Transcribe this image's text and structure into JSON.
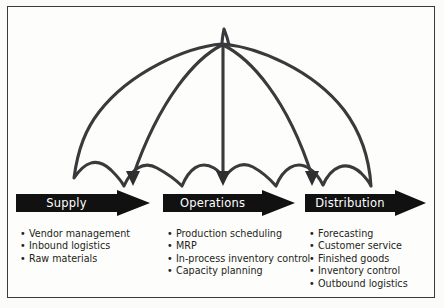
{
  "diagram": {
    "background_color": "#fbfbf9",
    "border_color": "#3a3a3c",
    "ink_color": "#231f20",
    "arrow_fill": "#111111",
    "arrow_text_color": "#ffffff",
    "bullet_glyph": "•"
  },
  "umbrella": {
    "name": "umbrella-canopy",
    "outline_color": "#3a3a3c",
    "scallop_count": 4,
    "rib_count": 3,
    "has_finial": true,
    "rib_tips_are_arrowheads": true
  },
  "stages": [
    {
      "id": "supply",
      "arrow_label": "Supply",
      "items": [
        "Vendor management",
        "Inbound logistics",
        "Raw materials"
      ]
    },
    {
      "id": "operations",
      "arrow_label": "Operations",
      "items": [
        "Production scheduling",
        "MRP",
        "In-process inventory control",
        "Capacity planning"
      ]
    },
    {
      "id": "distribution",
      "arrow_label": "Distribution",
      "items": [
        "Forecasting",
        "Customer service",
        "Finished goods",
        "Inventory control",
        "Outbound logistics"
      ]
    }
  ]
}
